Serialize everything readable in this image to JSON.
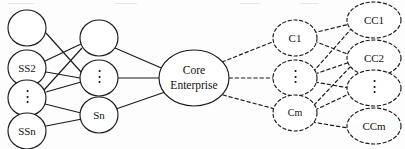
{
  "diagram": {
    "type": "node-link-graph",
    "columns": [
      {
        "id": "sub-suppliers",
        "name": "sub-supplier-column",
        "node_style": "solid-circle",
        "nodes": [
          {
            "id": "ss1",
            "label": "",
            "cx": 27,
            "cy": 28,
            "rx": 19,
            "ry": 18
          },
          {
            "id": "ss2",
            "label": "SS2",
            "cx": 27,
            "cy": 68,
            "rx": 19,
            "ry": 18
          },
          {
            "id": "ssdots",
            "label": "⋮",
            "cx": 27,
            "cy": 98,
            "rx": 19,
            "ry": 18
          },
          {
            "id": "ssn",
            "label": "SSn",
            "cx": 27,
            "cy": 131,
            "rx": 19,
            "ry": 18
          }
        ]
      },
      {
        "id": "suppliers",
        "name": "supplier-column",
        "node_style": "solid-circle",
        "nodes": [
          {
            "id": "s1",
            "label": "",
            "cx": 99,
            "cy": 38,
            "rx": 19,
            "ry": 18
          },
          {
            "id": "sdots",
            "label": "⋮",
            "cx": 99,
            "cy": 78,
            "rx": 19,
            "ry": 18
          },
          {
            "id": "sn",
            "label": "Sn",
            "cx": 99,
            "cy": 115,
            "rx": 19,
            "ry": 18
          }
        ]
      },
      {
        "id": "core",
        "name": "core-enterprise-column",
        "node_style": "solid-ellipse",
        "nodes": [
          {
            "id": "core",
            "label_line1": "Core",
            "label_line2": "Enterprise",
            "cx": 194,
            "cy": 78,
            "rx": 35,
            "ry": 28
          }
        ]
      },
      {
        "id": "customers",
        "name": "customer-column",
        "node_style": "dashed-ellipse",
        "nodes": [
          {
            "id": "c1",
            "label": "C1",
            "cx": 295,
            "cy": 38,
            "rx": 22,
            "ry": 18
          },
          {
            "id": "cdots",
            "label": "⋮",
            "cx": 295,
            "cy": 78,
            "rx": 22,
            "ry": 18
          },
          {
            "id": "cm",
            "label": "Cm",
            "cx": 295,
            "cy": 113,
            "rx": 22,
            "ry": 18
          }
        ]
      },
      {
        "id": "end-customers",
        "name": "end-customer-column",
        "node_style": "dashed-ellipse",
        "nodes": [
          {
            "id": "cc1",
            "label": "CC1",
            "cx": 374,
            "cy": 20,
            "rx": 27,
            "ry": 18
          },
          {
            "id": "cc2",
            "label": "CC2",
            "cx": 374,
            "cy": 58,
            "rx": 27,
            "ry": 18
          },
          {
            "id": "ccdots",
            "label": "⋮",
            "cx": 374,
            "cy": 88,
            "rx": 27,
            "ry": 18
          },
          {
            "id": "ccm",
            "label": "CCm",
            "cx": 374,
            "cy": 126,
            "rx": 27,
            "ry": 18
          }
        ]
      }
    ],
    "edges_solid": [
      {
        "from": "ss1",
        "to": "sdots",
        "x1": 46,
        "y1": 33,
        "x2": 81,
        "y2": 72
      },
      {
        "from": "ss2",
        "to": "s1",
        "x1": 45,
        "y1": 61,
        "x2": 81,
        "y2": 44
      },
      {
        "from": "ss2",
        "to": "sdots",
        "x1": 46,
        "y1": 72,
        "x2": 80,
        "y2": 78
      },
      {
        "from": "ssdots",
        "to": "s1",
        "x1": 44,
        "y1": 90,
        "x2": 82,
        "y2": 48
      },
      {
        "from": "ssdots",
        "to": "sdots",
        "x1": 46,
        "y1": 92,
        "x2": 81,
        "y2": 82
      },
      {
        "from": "ssdots",
        "to": "sn",
        "x1": 45,
        "y1": 104,
        "x2": 81,
        "y2": 113
      },
      {
        "from": "ssn",
        "to": "sn",
        "x1": 46,
        "y1": 126,
        "x2": 82,
        "y2": 119
      },
      {
        "from": "s1",
        "to": "core",
        "x1": 115,
        "y1": 48,
        "x2": 166,
        "y2": 70
      },
      {
        "from": "sdots",
        "to": "core",
        "x1": 118,
        "y1": 78,
        "x2": 160,
        "y2": 78
      },
      {
        "from": "sn",
        "to": "core",
        "x1": 116,
        "y1": 109,
        "x2": 168,
        "y2": 91
      }
    ],
    "edges_dashed": [
      {
        "from": "core",
        "to": "c1",
        "x1": 222,
        "y1": 62,
        "x2": 275,
        "y2": 41
      },
      {
        "from": "core",
        "to": "cdots",
        "x1": 229,
        "y1": 78,
        "x2": 273,
        "y2": 78
      },
      {
        "from": "core",
        "to": "cm",
        "x1": 223,
        "y1": 95,
        "x2": 275,
        "y2": 109
      },
      {
        "from": "c1",
        "to": "cc1",
        "x1": 313,
        "y1": 33,
        "x2": 350,
        "y2": 24
      },
      {
        "from": "c1",
        "to": "cc2",
        "x1": 314,
        "y1": 41,
        "x2": 350,
        "y2": 55
      },
      {
        "from": "cdots",
        "to": "cc1",
        "x1": 313,
        "y1": 72,
        "x2": 352,
        "y2": 28
      },
      {
        "from": "cdots",
        "to": "cc2",
        "x1": 315,
        "y1": 74,
        "x2": 350,
        "y2": 62
      },
      {
        "from": "cdots",
        "to": "ccdots",
        "x1": 315,
        "y1": 82,
        "x2": 349,
        "y2": 88
      },
      {
        "from": "cm",
        "to": "cc2",
        "x1": 314,
        "y1": 105,
        "x2": 351,
        "y2": 66
      },
      {
        "from": "cm",
        "to": "ccdots",
        "x1": 315,
        "y1": 110,
        "x2": 349,
        "y2": 94
      },
      {
        "from": "cm",
        "to": "ccm",
        "x1": 312,
        "y1": 122,
        "x2": 348,
        "y2": 128
      }
    ]
  }
}
